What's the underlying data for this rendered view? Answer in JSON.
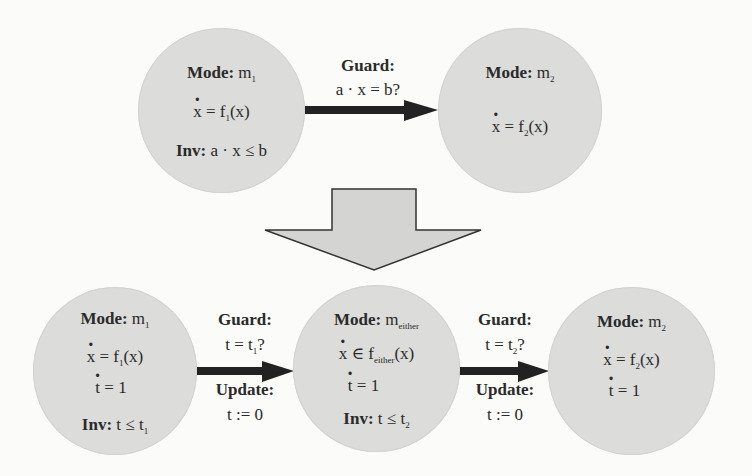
{
  "top": {
    "mode_m1": {
      "mode_label": "Mode:",
      "mode_name": "m",
      "mode_sub": "1",
      "dyn_lhs": "x",
      "dyn_op": " = f",
      "dyn_sub": "1",
      "dyn_rhs": "(x)",
      "inv_label": "Inv:",
      "inv_expr": " a · x ≤ b"
    },
    "transition": {
      "guard_label": "Guard:",
      "guard_expr": "a · x = b?"
    },
    "mode_m2": {
      "mode_label": "Mode:",
      "mode_name": "m",
      "mode_sub": "2",
      "dyn_lhs": "x",
      "dyn_op": " = f",
      "dyn_sub": "2",
      "dyn_rhs": "(x)"
    }
  },
  "bottom": {
    "mode_m1": {
      "mode_label": "Mode:",
      "mode_name": "m",
      "mode_sub": "1",
      "dyn_lhs": "x",
      "dyn_op": " = f",
      "dyn_sub": "1",
      "dyn_rhs": "(x)",
      "clock_lhs": "t",
      "clock_rhs": " = 1",
      "inv_label": "Inv:",
      "inv_expr": " t ≤ t",
      "inv_sub": "1"
    },
    "transition1": {
      "guard_label": "Guard:",
      "guard_expr": "t = t",
      "guard_sub": "1",
      "guard_q": "?",
      "update_label": "Update:",
      "update_expr": "t := 0"
    },
    "mode_either": {
      "mode_label": "Mode:",
      "mode_name": "m",
      "mode_sub": "either",
      "dyn_lhs": "x",
      "dyn_op": " ∈ f",
      "dyn_sub": "either",
      "dyn_rhs": "(x)",
      "clock_lhs": "t",
      "clock_rhs": " = 1",
      "inv_label": "Inv:",
      "inv_expr": " t ≤ t",
      "inv_sub": "2"
    },
    "transition2": {
      "guard_label": "Guard:",
      "guard_expr": "t = t",
      "guard_sub": "2",
      "guard_q": "?",
      "update_label": "Update:",
      "update_expr": "t := 0"
    },
    "mode_m2": {
      "mode_label": "Mode:",
      "mode_name": "m",
      "mode_sub": "2",
      "dyn_lhs": "x",
      "dyn_op": " = f",
      "dyn_sub": "2",
      "dyn_rhs": "(x)",
      "clock_lhs": "t",
      "clock_rhs": " = 1"
    }
  },
  "colors": {
    "node_fill": "#dcdcda",
    "arrow": "#222222",
    "transform_arrow_fill": "#d4d4d2",
    "background": "#fbfbf9"
  }
}
